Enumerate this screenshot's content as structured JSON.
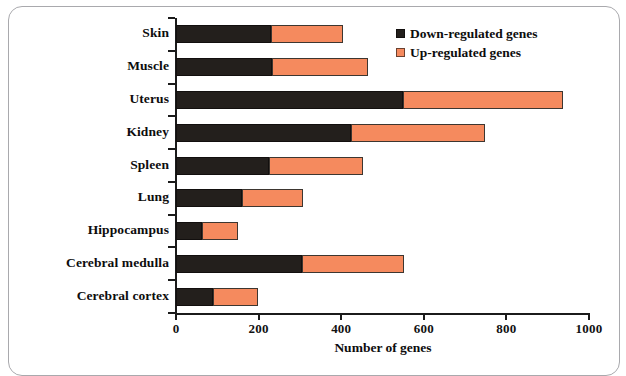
{
  "chart_data": {
    "type": "bar",
    "orientation": "horizontal",
    "stacked": true,
    "title": "",
    "xlabel": "Number of genes",
    "ylabel": "",
    "xlim": [
      0,
      1000
    ],
    "xticks": [
      0,
      200,
      400,
      600,
      800,
      1000
    ],
    "xtick_labels": [
      "0",
      "200",
      "400",
      "600",
      "800",
      "1000"
    ],
    "grid": false,
    "legend_position": "top-right",
    "categories": [
      "Skin",
      "Muscle",
      "Uterus",
      "Kidney",
      "Spleen",
      "Lung",
      "Hippocampus",
      "Cerebral medulla",
      "Cerebral cortex"
    ],
    "series": [
      {
        "name": "Down-regulated genes",
        "color": "#231f1c",
        "values": [
          230,
          232,
          550,
          424,
          225,
          160,
          62,
          305,
          89
        ]
      },
      {
        "name": "Up-regulated genes",
        "color": "#f58a5e",
        "values": [
          174,
          233,
          387,
          324,
          228,
          147,
          89,
          247,
          109
        ]
      }
    ],
    "totals": [
      404,
      465,
      937,
      748,
      453,
      307,
      151,
      552,
      198
    ]
  },
  "legend": {
    "items": [
      {
        "label": "Down-regulated genes",
        "swatch": "black-square"
      },
      {
        "label": "Up-regulated genes",
        "swatch": "orange-square"
      }
    ]
  },
  "axis": {
    "x_title": "Number of genes"
  }
}
